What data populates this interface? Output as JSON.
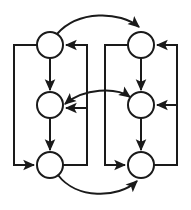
{
  "figure": {
    "kind": "node-link-diagram",
    "background_color": "#ffffff",
    "stroke_color": "#1a1a1a",
    "node_fill_color": "#ffffff",
    "stroke_width": 2,
    "width": 191,
    "height": 210
  },
  "nodes": [
    {
      "id": "n-top-left",
      "label": "",
      "cx": 50,
      "cy": 45,
      "r": 13
    },
    {
      "id": "n-middle-left",
      "label": "",
      "cx": 50,
      "cy": 105,
      "r": 13
    },
    {
      "id": "n-bottom-left",
      "label": "",
      "cx": 50,
      "cy": 165,
      "r": 13
    },
    {
      "id": "n-top-right",
      "label": "",
      "cx": 141,
      "cy": 45,
      "r": 13
    },
    {
      "id": "n-middle-right",
      "label": "",
      "cx": 141,
      "cy": 105,
      "r": 13
    },
    {
      "id": "n-bottom-right",
      "label": "",
      "cx": 141,
      "cy": 165,
      "r": 13
    }
  ],
  "edges": [
    {
      "id": "e-tl-to-tr-arc",
      "from": "n-top-left",
      "to": "n-top-right",
      "shape": "arc-over-top",
      "arrowheads": 1
    },
    {
      "id": "e-tl-to-ml",
      "from": "n-top-left",
      "to": "n-middle-left",
      "shape": "vertical-down",
      "arrowheads": 1
    },
    {
      "id": "e-ml-to-bl",
      "from": "n-middle-left",
      "to": "n-bottom-left",
      "shape": "vertical-down",
      "arrowheads": 1
    },
    {
      "id": "e-tr-to-mr",
      "from": "n-top-right",
      "to": "n-middle-right",
      "shape": "vertical-down",
      "arrowheads": 1
    },
    {
      "id": "e-mr-to-br",
      "from": "n-middle-right",
      "to": "n-bottom-right",
      "shape": "vertical-down",
      "arrowheads": 1
    },
    {
      "id": "e-tl-to-bl-outer",
      "from": "n-top-left",
      "to": "n-bottom-left",
      "shape": "left-outer-loop",
      "arrowheads": 1
    },
    {
      "id": "e-br-to-tr-outer",
      "from": "n-bottom-right",
      "to": "n-top-right",
      "shape": "right-outer-loop",
      "arrowheads": 1
    },
    {
      "id": "e-br-to-mr-outer",
      "from": "n-bottom-right",
      "to": "n-middle-right",
      "shape": "right-outer-branch",
      "arrowheads": 1
    },
    {
      "id": "e-bl-to-tl-inner",
      "from": "n-bottom-left",
      "to": "n-top-left",
      "shape": "inner-left-loop",
      "arrowheads": 1
    },
    {
      "id": "e-bl-to-ml-inner",
      "from": "n-bottom-left",
      "to": "n-middle-left",
      "shape": "inner-left-branch",
      "arrowheads": 1
    },
    {
      "id": "e-tr-to-br-inner",
      "from": "n-top-right",
      "to": "n-bottom-right",
      "shape": "inner-right-loop",
      "arrowheads": 1
    },
    {
      "id": "e-ml-mr-arc",
      "from": "n-middle-left",
      "to": "n-middle-right",
      "shape": "arc-bidirectional",
      "arrowheads": 2
    },
    {
      "id": "e-bl-to-br-arc",
      "from": "n-bottom-left",
      "to": "n-bottom-right",
      "shape": "arc-under-bottom",
      "arrowheads": 1
    }
  ]
}
